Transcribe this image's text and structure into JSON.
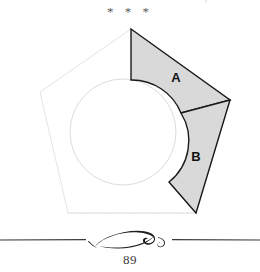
{
  "page": {
    "number": "89",
    "top_ornament": "* * *",
    "cut_text_top": "j"
  },
  "figure": {
    "name": "pentagon-circle-shaded-regions",
    "labels": [
      {
        "id": "A",
        "text": "A",
        "x": 176,
        "y": 77
      },
      {
        "id": "B",
        "text": "B",
        "x": 196,
        "y": 156
      }
    ],
    "colors": {
      "shade_fill": "#d9d9d9",
      "shade_stroke": "#1a1a1a",
      "faint_outline": "#e2e2e2",
      "circle_outline": "#dadada",
      "rule": "#2b2b2b",
      "label_text": "#111111"
    },
    "pentagon": {
      "vertices": [
        [
          131,
          29
        ],
        [
          230,
          100
        ],
        [
          196,
          213
        ],
        [
          68,
          213
        ],
        [
          40,
          92
        ]
      ]
    },
    "circle": {
      "cx": 123,
      "cy": 132,
      "r": 53
    },
    "region_a": {
      "label": "A",
      "description": "region bounded by vertical chord, pentagon upper-right edge, cut line and circle arc"
    },
    "region_b": {
      "label": "B",
      "description": "region bounded by circle arc, pentagon right edge and lower cut line"
    }
  },
  "footer": {
    "ornament_name": "flourish-divider",
    "rule_left_start": 0,
    "rule_right_end": 260
  }
}
